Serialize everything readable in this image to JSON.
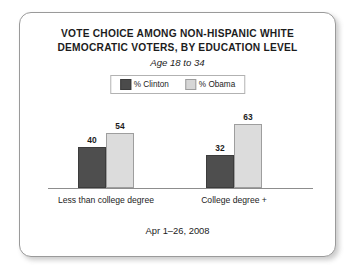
{
  "card": {
    "title_line_1": "VOTE CHOICE AMONG NON-HISPANIC WHITE",
    "title_line_2": "DEMOCRATIC VOTERS, BY EDUCATION LEVEL",
    "subtitle": "Age 18 to 34",
    "footer": "Apr 1–26, 2008"
  },
  "legend": {
    "entries": [
      {
        "label": "% Clinton",
        "color": "#4e4e4e"
      },
      {
        "label": "% Obama",
        "color": "#dcdcdc"
      }
    ]
  },
  "chart_data": {
    "type": "bar",
    "title": "VOTE CHOICE AMONG NON-HISPANIC WHITE DEMOCRATIC VOTERS, BY EDUCATION LEVEL",
    "subtitle": "Age 18 to 34",
    "annotation": "Apr 1–26, 2008",
    "categories": [
      "Less than college degree",
      "College degree +"
    ],
    "series": [
      {
        "name": "% Clinton",
        "values": [
          40,
          32
        ],
        "color": "#4e4e4e"
      },
      {
        "name": "% Obama",
        "values": [
          54,
          63
        ],
        "color": "#dcdcdc"
      }
    ],
    "value_labels": [
      [
        "40",
        "54"
      ],
      [
        "32",
        "63"
      ]
    ],
    "xlabel": "",
    "ylabel": "",
    "ylim": [
      0,
      63
    ],
    "grid": false,
    "axis": "baseline-only",
    "legend_position": "top-center"
  }
}
